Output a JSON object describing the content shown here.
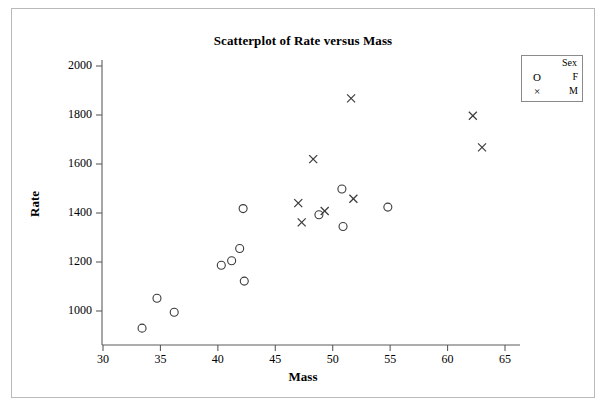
{
  "chart_data": {
    "type": "scatter",
    "title": "Scatterplot of Rate versus Mass",
    "xlabel": "Mass",
    "ylabel": "Rate",
    "xlim": [
      28.5,
      66.5
    ],
    "ylim": [
      860,
      2030
    ],
    "xticks": [
      30,
      35,
      40,
      45,
      50,
      55,
      60,
      65
    ],
    "yticks": [
      1000,
      1200,
      1400,
      1600,
      1800,
      2000
    ],
    "grid": false,
    "legend": {
      "title": "Sex",
      "position": "top-right",
      "entries": [
        {
          "symbol": "O",
          "label": "F",
          "marker": "circle"
        },
        {
          "symbol": "×",
          "label": "M",
          "marker": "cross"
        }
      ]
    },
    "series": [
      {
        "name": "F",
        "marker": "circle",
        "points": [
          {
            "x": 33.4,
            "y": 930
          },
          {
            "x": 34.7,
            "y": 1052
          },
          {
            "x": 36.2,
            "y": 995
          },
          {
            "x": 40.3,
            "y": 1187
          },
          {
            "x": 41.2,
            "y": 1205
          },
          {
            "x": 41.9,
            "y": 1255
          },
          {
            "x": 42.2,
            "y": 1418
          },
          {
            "x": 42.3,
            "y": 1122
          },
          {
            "x": 48.8,
            "y": 1393
          },
          {
            "x": 50.8,
            "y": 1498
          },
          {
            "x": 50.9,
            "y": 1345
          },
          {
            "x": 54.8,
            "y": 1424
          }
        ]
      },
      {
        "name": "M",
        "marker": "cross",
        "points": [
          {
            "x": 47.0,
            "y": 1440
          },
          {
            "x": 47.3,
            "y": 1362
          },
          {
            "x": 48.3,
            "y": 1620
          },
          {
            "x": 49.3,
            "y": 1408
          },
          {
            "x": 51.6,
            "y": 1868
          },
          {
            "x": 51.8,
            "y": 1458
          },
          {
            "x": 62.2,
            "y": 1797
          },
          {
            "x": 63.0,
            "y": 1668
          }
        ]
      }
    ]
  }
}
